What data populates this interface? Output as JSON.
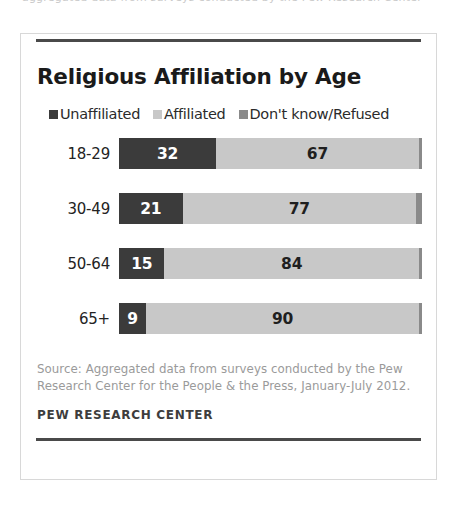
{
  "top_artifact": "aggregated data from surveys conducted by the Pew Research Center",
  "card": {
    "title": "Religious Affiliation by Age",
    "source": "Source: Aggregated data from surveys conducted by the Pew Research Center for the People & the Press, January-July 2012.",
    "attribution": "PEW RESEARCH CENTER"
  },
  "colors": {
    "unaffiliated": "#3b3b3b",
    "affiliated": "#c8c8c8",
    "dont_know": "#8a8a8a",
    "rule": "#4a4a4a",
    "border": "#d8d8d8",
    "title_text": "#1a1a1a",
    "source_text": "#9a9a9a"
  },
  "legend": {
    "items": [
      {
        "label": "Unaffiliated",
        "color": "#3b3b3b"
      },
      {
        "label": "Affiliated",
        "color": "#c8c8c8"
      },
      {
        "label": "Don't know/Refused",
        "color": "#8a8a8a"
      }
    ]
  },
  "chart_data": {
    "type": "bar",
    "orientation": "horizontal",
    "stacked": true,
    "title": "Religious Affiliation by Age",
    "xlabel": "",
    "ylabel": "",
    "xlim": [
      0,
      100
    ],
    "grid": false,
    "legend_position": "top-left",
    "categories": [
      "18-29",
      "30-49",
      "50-64",
      "65+"
    ],
    "series": [
      {
        "name": "Unaffiliated",
        "color": "#3b3b3b",
        "values": [
          32,
          21,
          15,
          9
        ]
      },
      {
        "name": "Affiliated",
        "color": "#c8c8c8",
        "values": [
          67,
          77,
          84,
          90
        ]
      },
      {
        "name": "Don't know/Refused",
        "color": "#8a8a8a",
        "values": [
          1,
          2,
          1,
          1
        ]
      }
    ],
    "rows": [
      {
        "category": "18-29",
        "segments": [
          {
            "series": "Unaffiliated",
            "value": 32,
            "label": "32",
            "show_label": true
          },
          {
            "series": "Affiliated",
            "value": 67,
            "label": "67",
            "show_label": true
          },
          {
            "series": "Don't know/Refused",
            "value": 1,
            "label": "1",
            "show_label": false
          }
        ]
      },
      {
        "category": "30-49",
        "segments": [
          {
            "series": "Unaffiliated",
            "value": 21,
            "label": "21",
            "show_label": true
          },
          {
            "series": "Affiliated",
            "value": 77,
            "label": "77",
            "show_label": true
          },
          {
            "series": "Don't know/Refused",
            "value": 2,
            "label": "2",
            "show_label": false
          }
        ]
      },
      {
        "category": "50-64",
        "segments": [
          {
            "series": "Unaffiliated",
            "value": 15,
            "label": "15",
            "show_label": true
          },
          {
            "series": "Affiliated",
            "value": 84,
            "label": "84",
            "show_label": true
          },
          {
            "series": "Don't know/Refused",
            "value": 1,
            "label": "1",
            "show_label": false
          }
        ]
      },
      {
        "category": "65+",
        "segments": [
          {
            "series": "Unaffiliated",
            "value": 9,
            "label": "9",
            "show_label": true
          },
          {
            "series": "Affiliated",
            "value": 90,
            "label": "90",
            "show_label": true
          },
          {
            "series": "Don't know/Refused",
            "value": 1,
            "label": "1",
            "show_label": false
          }
        ]
      }
    ]
  }
}
